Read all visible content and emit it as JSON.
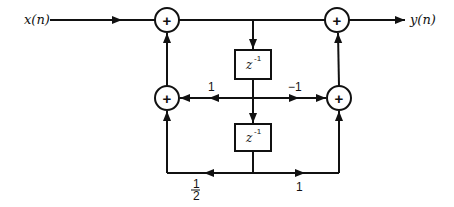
{
  "diagram": {
    "type": "signal-flow-block-diagram",
    "input": {
      "label": "x(n)"
    },
    "output": {
      "label": "y(n)"
    },
    "adders": [
      {
        "id": "adder-top-left",
        "symbol": "+"
      },
      {
        "id": "adder-top-right",
        "symbol": "+"
      },
      {
        "id": "adder-mid-left",
        "symbol": "+"
      },
      {
        "id": "adder-mid-right",
        "symbol": "+"
      }
    ],
    "delays": [
      {
        "id": "delay-1",
        "base": "z",
        "exponent": "-1"
      },
      {
        "id": "delay-2",
        "base": "z",
        "exponent": "-1"
      }
    ],
    "gains": {
      "mid_left": "1",
      "mid_right": "−1",
      "bottom_left_num": "1",
      "bottom_left_den": "2",
      "bottom_right": "1"
    },
    "colors": {
      "line": "#111111",
      "background": "#ffffff"
    }
  }
}
